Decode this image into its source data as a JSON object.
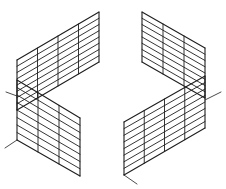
{
  "figure": {
    "stroke_color": "#1e1e1e",
    "background": "#ffffff",
    "panels": [
      {
        "name": "top-left-panel",
        "corners": [
          [
            17,
            60
          ],
          [
            99,
            12
          ],
          [
            99,
            62
          ],
          [
            17,
            110
          ]
        ],
        "columns": 4,
        "rows": 8
      },
      {
        "name": "top-right-panel",
        "corners": [
          [
            142,
            12
          ],
          [
            205,
            48
          ],
          [
            205,
            98
          ],
          [
            142,
            62
          ]
        ],
        "columns": 3,
        "rows": 8
      },
      {
        "name": "bottom-left-panel",
        "corners": [
          [
            17,
            80
          ],
          [
            80,
            118
          ],
          [
            80,
            176
          ],
          [
            17,
            140
          ]
        ],
        "columns": 3,
        "rows": 8
      },
      {
        "name": "bottom-right-panel",
        "corners": [
          [
            124,
            122
          ],
          [
            205,
            76
          ],
          [
            205,
            128
          ],
          [
            124,
            175
          ]
        ],
        "columns": 4,
        "rows": 8
      }
    ],
    "axes": [
      {
        "name": "left-axis-tick",
        "from": [
          17,
          140
        ],
        "to": [
          5,
          148
        ]
      },
      {
        "name": "left-mid-tick",
        "from": [
          17,
          96
        ],
        "to": [
          6,
          92
        ]
      },
      {
        "name": "right-axis-tick",
        "from": [
          205,
          100
        ],
        "to": [
          221,
          92
        ]
      },
      {
        "name": "bottom-right-tick",
        "from": [
          124,
          175
        ],
        "to": [
          137,
          184
        ]
      }
    ]
  }
}
